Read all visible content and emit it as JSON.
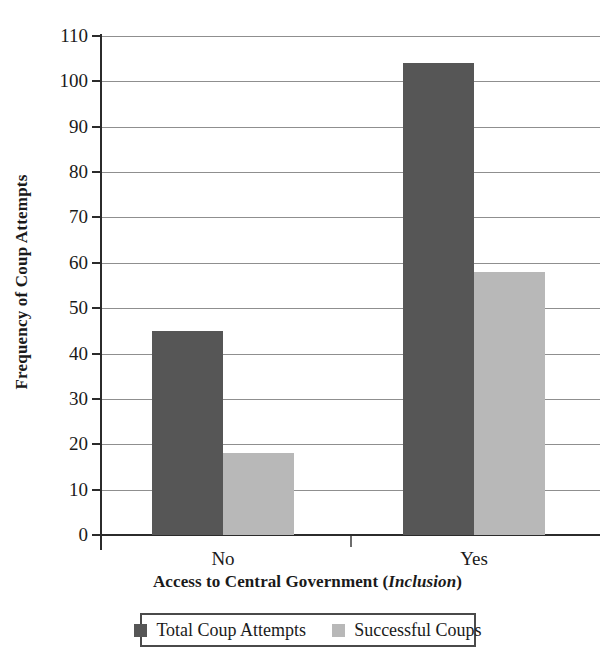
{
  "chart_data": {
    "type": "bar",
    "title": "",
    "categories": [
      "No",
      "Yes"
    ],
    "series": [
      {
        "name": "Total Coup Attempts",
        "values": [
          45,
          104
        ],
        "color": "#565656"
      },
      {
        "name": "Successful Coups",
        "values": [
          18,
          58
        ],
        "color": "#b8b8b8"
      }
    ],
    "xlabel": "Access to Central Government (Inclusion)",
    "xlabel_plain": "Access to Central Government (",
    "xlabel_italic": "Inclusion",
    "xlabel_tail": ")",
    "ylabel": "Frequency of Coup Attempts",
    "ylim": [
      0,
      110
    ],
    "ytick_step": 10,
    "yticks": [
      "0",
      "10",
      "20",
      "30",
      "40",
      "50",
      "60",
      "70",
      "80",
      "90",
      "100",
      "110"
    ],
    "grid": true,
    "grid_axis": "y",
    "legend_position": "bottom"
  },
  "axes": {
    "y_title": "Frequency of Coup Attempts",
    "x_title_prefix": "Access to Central Government (",
    "x_title_emphasis": "Inclusion",
    "x_title_suffix": ")"
  },
  "legend": {
    "entries": [
      {
        "label": "Total Coup Attempts",
        "color": "#565656"
      },
      {
        "label": "Successful Coups",
        "color": "#b8b8b8"
      }
    ]
  },
  "colors": {
    "series_total": "#565656",
    "series_success": "#b8b8b8",
    "axis": "#2b2b2b",
    "grid": "#8f8f8f",
    "background": "#ffffff"
  }
}
